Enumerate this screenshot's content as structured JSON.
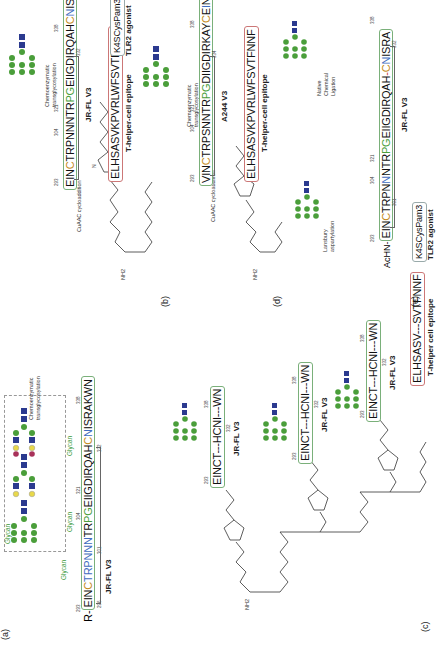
{
  "figure": {
    "rotation": "-90deg",
    "panels": {
      "a": {
        "label": "(a)",
        "prefix": "R-",
        "sequence": [
          "EIN",
          "C",
          "TRPNN",
          "N",
          "TR",
          "PG",
          "EIIGDIRQAH",
          "C",
          "N",
          "ISRAKWN"
        ],
        "numbers": [
          "293",
          "296",
          "301",
          "304",
          "321",
          "332",
          "338"
        ],
        "glycan_labels": [
          "Glycan",
          "Glycan",
          "Glycan",
          "Glycan"
        ],
        "construct_label": "JR-FL V3",
        "inset_label": "Chemoenzymatic transglycosylation"
      },
      "b": {
        "label": "(b)",
        "sequence": [
          "EIN",
          "C",
          "TRPNNNTR",
          "PG",
          "EIIGDIRQAH",
          "C",
          "N",
          "ISRAKWN"
        ],
        "numbers": [
          "293",
          "304",
          "321",
          "332",
          "338"
        ],
        "construct_label": "JR-FL V3",
        "glyco_label": "Chemoenzymatic transglycosylation",
        "click_label": "CuAAC cycloaddition",
        "t_helper": "ELHSASVKPVRLWFSVTFNNF",
        "t_helper_label": "T-helper-cell epitope",
        "tlr2": "K4SCysPam3",
        "tlr2_label": "TLR2 agonist",
        "nh2": "NH2"
      },
      "c": {
        "label": "(c)",
        "units": [
          {
            "sequence": "EINCT---HCNI---WN",
            "construct_label": "JR-FL V3",
            "numbers": [
              "293",
              "332",
              "338"
            ]
          },
          {
            "sequence": "EINCT---HCNI---WN",
            "construct_label": "JR-FL V3",
            "numbers": [
              "293",
              "332",
              "338"
            ]
          },
          {
            "sequence": "EINCT---HCNI---WN",
            "construct_label": "JR-FL V3",
            "numbers": [
              "293",
              "332",
              "338"
            ]
          }
        ],
        "t_helper": "ELHSASV---SVTFNNF",
        "t_helper_label": "T-helper cell epitope",
        "tlr2": "K4SCysPam3",
        "tlr2_label": "TLR2 agonist",
        "nh2": "NH2"
      },
      "d": {
        "label": "(d)",
        "sequence": [
          "VIN",
          "C",
          "TRPSNNTR",
          "PG",
          "DIIGDIRKAY",
          "C",
          "E",
          "I",
          "NGTEWN"
        ],
        "numbers": [
          "293",
          "304",
          "321",
          "334",
          "338"
        ],
        "construct_label": "A244 V3",
        "glyco_label": "Chemoenzymatic transglycosylation",
        "click_label": "CuAAC cycloaddition",
        "t_helper": "ELHSASVKPVRLWFSVTFNNF",
        "t_helper_label": "T-helper-cell epitope",
        "tlr2": "K4SCysPam3",
        "tlr2_label": "TLR2 agonist",
        "nh2": "NH2"
      },
      "e": {
        "label": "(e)",
        "prefix": "AcHN-",
        "sequence_1": [
          "EIN",
          "C",
          "TRPN",
          "N",
          "NTR",
          "PG",
          "EIIGDIRQAH"
        ],
        "sequence_2": [
          "C",
          "N",
          "ISRA"
        ],
        "numbers": [
          "293",
          "301",
          "304",
          "321",
          "332",
          "338"
        ],
        "lansbury_label": "Lansbury aspartylation",
        "ncl_label": "Native Chemical Ligation",
        "construct_label": "JR-FL V3"
      }
    },
    "colors": {
      "glycan_green": "#4a9e3a",
      "glcnac_blue": "#2b3a8f",
      "cys_orange": "#c48a1a",
      "asn_blue": "#3f6cc0",
      "galactose_yellow": "#e8d84a",
      "sialic_red": "#a8325a"
    }
  }
}
